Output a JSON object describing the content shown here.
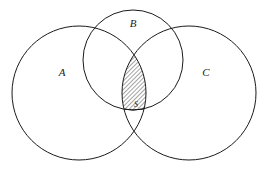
{
  "diagram": {
    "type": "venn-diagram",
    "background_color": "#ffffff",
    "stroke_color": "#1a1a1a",
    "shade_fill_color": "#ffffff",
    "hatch_color": "#1a1a1a",
    "hatch_angle_degrees": 45,
    "hatch_spacing_px": 3,
    "sets": [
      {
        "id": "set-a",
        "label": "A",
        "label_x": 62,
        "label_y": 76,
        "center_x": 79,
        "center_y": 93,
        "radius": 67
      },
      {
        "id": "set-b",
        "label": "B",
        "label_x": 133,
        "label_y": 27,
        "center_x": 133,
        "center_y": 60,
        "radius": 50
      },
      {
        "id": "set-c",
        "label": "C",
        "label_x": 206,
        "label_y": 76,
        "center_x": 189,
        "center_y": 93,
        "radius": 67
      }
    ],
    "shaded_region": {
      "id": "region-s",
      "label": "S",
      "label_x": 136,
      "label_y": 107,
      "description": "intersection of A, B and C",
      "top_vertex_x": 135,
      "top_vertex_y": 45
    }
  }
}
